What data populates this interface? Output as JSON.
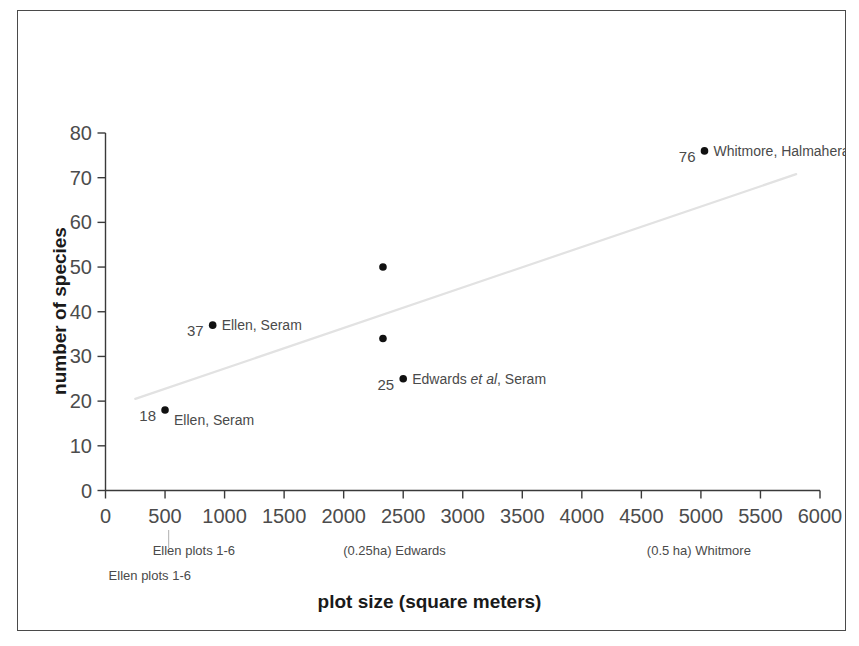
{
  "chart_data": {
    "type": "scatter",
    "title": "",
    "xlabel": "plot size (square meters)",
    "ylabel": "number of species",
    "xlim": [
      0,
      6000
    ],
    "ylim": [
      0,
      80
    ],
    "grid": false,
    "legend": "none",
    "xticks": [
      "0",
      "500",
      "1000",
      "1500",
      "2000",
      "2500",
      "3000",
      "3500",
      "4000",
      "4500",
      "5000",
      "5500",
      "6000"
    ],
    "yticks": [
      "0",
      "10",
      "20",
      "30",
      "40",
      "50",
      "60",
      "70",
      "80"
    ],
    "points": [
      {
        "x": 500,
        "y": 18,
        "value_label": "18",
        "name": "Ellen, Seram",
        "name_italic": ""
      },
      {
        "x": 900,
        "y": 37,
        "value_label": "37",
        "name": "Ellen, Seram",
        "name_italic": ""
      },
      {
        "x": 2330,
        "y": 50,
        "value_label": "",
        "name": "",
        "name_italic": ""
      },
      {
        "x": 2330,
        "y": 34,
        "value_label": "",
        "name": "",
        "name_italic": ""
      },
      {
        "x": 2500,
        "y": 25,
        "value_label": "25",
        "name_pre": "Edwards ",
        "name_italic": "et al",
        "name_post": ",  Seram"
      },
      {
        "x": 5030,
        "y": 76,
        "value_label": "76",
        "name": "Whitmore, Halmahera",
        "name_italic": ""
      }
    ],
    "trendline": {
      "x0": 250,
      "y0": 20.5,
      "x1": 5800,
      "y1": 70.8,
      "style": "faint-gray"
    },
    "category_annotations": [
      {
        "text": "Ellen plots 1-6",
        "x": 900,
        "row": 0
      },
      {
        "text": "Ellen plots 1-6",
        "x": 530,
        "row": 1
      },
      {
        "text": "(0.25ha) Edwards",
        "x": 2500,
        "row": 0
      },
      {
        "text": "(0.5 ha) Whitmore",
        "x": 5050,
        "row": 0
      }
    ],
    "category_tick": {
      "x": 530
    }
  },
  "colors": {
    "frame": "#4a4a4a",
    "axis": "#3a3a3a",
    "marker": "#111111",
    "tick_text": "#4c4c4c",
    "title_text": "#1a1a1a",
    "annotation_text": "#4a4a4a",
    "trendline": "#e2e2e2",
    "background": "#ffffff"
  }
}
